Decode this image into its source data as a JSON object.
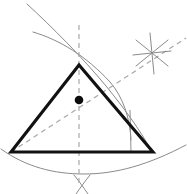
{
  "figure": {
    "width": 187,
    "height": 194,
    "background_color": "#ffffff"
  },
  "colors": {
    "triangle_stroke": "#121212",
    "arc_stroke": "#8a8a8a",
    "dashed_stroke": "#a8a8a8",
    "point_fill": "#0d0d0d",
    "thin_stroke": "#8f8f8f"
  },
  "strokes": {
    "triangle_width": 3.1,
    "arc_width": 1.0,
    "dashed_width": 1.2,
    "thin_width": 1.0,
    "dash_pattern": "5,4",
    "dash_pattern_short": "4,3"
  },
  "triangle": {
    "name": "main-triangle",
    "vertices": [
      {
        "label": "apex",
        "x": 79,
        "y": 65
      },
      {
        "label": "bottom-left",
        "x": 11,
        "y": 152
      },
      {
        "label": "bottom-right",
        "x": 153,
        "y": 152
      }
    ],
    "points_attr": "79,65 11,152 153,152"
  },
  "centroid": {
    "name": "centroid-point",
    "x": 79,
    "y": 100,
    "radius": 4.3
  },
  "median_vertical": {
    "name": "median-vertical-dashed",
    "x1": 79,
    "y1": 25,
    "x2": 79,
    "y2": 186
  },
  "median_diagonal": {
    "name": "median-diagonal-dashed",
    "x1": 11,
    "y1": 152,
    "x2": 186,
    "y2": 38
  },
  "arcs": [
    {
      "name": "arc-upper-left-sweep",
      "d": "M 33 32 C 60 40, 86 56, 110 82 C 123 97, 130 118, 131 140"
    },
    {
      "name": "arc-upper-right-sweep",
      "d": "M 27 4 C 52 27, 82 57, 106 86 C 124 108, 140 130, 151 150"
    },
    {
      "name": "arc-lower-base-sweep",
      "d": "M 1 149 C 26 167, 54 174, 84 174 C 116 174, 148 165, 186 145"
    }
  ],
  "thin_lines": [
    {
      "name": "perpendicular-tick-line",
      "x1": 130,
      "y1": 110,
      "x2": 131,
      "y2": 152
    }
  ],
  "star_marker": {
    "name": "arc-intersection-star",
    "x": 152,
    "y": 53,
    "rays": [
      {
        "name": "star-ray-1",
        "x1": 136,
        "y1": 40,
        "x2": 168,
        "y2": 66
      },
      {
        "name": "star-ray-2",
        "x1": 168,
        "y1": 40,
        "x2": 136,
        "y2": 66
      },
      {
        "name": "star-ray-3",
        "x1": 150,
        "y1": 33,
        "x2": 154,
        "y2": 74
      },
      {
        "name": "star-ray-4",
        "x1": 133,
        "y1": 55,
        "x2": 171,
        "y2": 51
      }
    ]
  },
  "bottom_cross_marker": {
    "name": "bottom-arc-intersection-cross",
    "x": 82,
    "y": 185,
    "strokes": [
      {
        "name": "bottom-cross-stroke-left",
        "d": "M 74 175 C 78 180, 84 188, 88 194"
      },
      {
        "name": "bottom-cross-stroke-right",
        "d": "M 90 175 C 86 180, 80 188, 76 194"
      }
    ]
  },
  "top_cross_intersection": {
    "name": "upper-arc-intersection",
    "x": 60,
    "y": 42
  }
}
